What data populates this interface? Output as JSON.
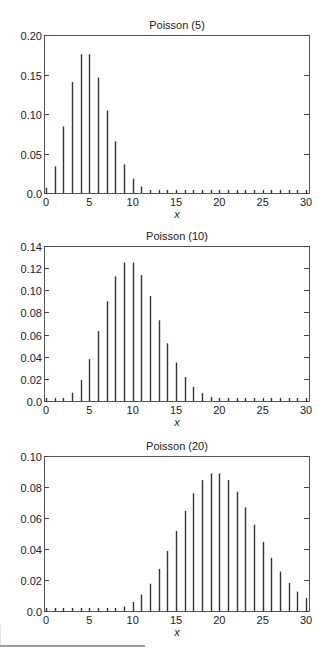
{
  "chart_data": [
    {
      "type": "bar",
      "title": "Poisson (5)",
      "xlabel": "x",
      "ylabel": "",
      "xlim": [
        0,
        30
      ],
      "ylim": [
        0,
        0.2
      ],
      "xticks": [
        "0",
        "5",
        "10",
        "15",
        "20",
        "25",
        "30"
      ],
      "yticks": [
        "0.0",
        "0.05",
        "0.10",
        "0.15",
        "0.20"
      ],
      "ytick_values": [
        0,
        0.05,
        0.1,
        0.15,
        0.2
      ],
      "grid": false,
      "legend": null,
      "x": [
        0,
        1,
        2,
        3,
        4,
        5,
        6,
        7,
        8,
        9,
        10,
        11,
        12,
        13,
        14,
        15,
        16,
        17,
        18,
        19,
        20,
        21,
        22,
        23,
        24,
        25,
        26,
        27,
        28,
        29,
        30
      ],
      "values": [
        0.0067,
        0.0337,
        0.0842,
        0.1404,
        0.1755,
        0.1755,
        0.1462,
        0.1044,
        0.0653,
        0.0363,
        0.0181,
        0.0082,
        0.0034,
        0.0013,
        0.0005,
        0.0002,
        0.0001,
        0,
        0,
        0,
        0,
        0,
        0,
        0,
        0,
        0,
        0,
        0,
        0,
        0,
        0
      ],
      "layout": {
        "top": 0,
        "height": 220,
        "plot_top": 35,
        "plot_bottom": 193
      }
    },
    {
      "type": "bar",
      "title": "Poisson (10)",
      "xlabel": "x",
      "ylabel": "",
      "xlim": [
        0,
        30
      ],
      "ylim": [
        0,
        0.14
      ],
      "xticks": [
        "0",
        "5",
        "10",
        "15",
        "20",
        "25",
        "30"
      ],
      "yticks": [
        "0.0",
        "0.02",
        "0.04",
        "0.06",
        "0.08",
        "0.10",
        "0.12",
        "0.14"
      ],
      "ytick_values": [
        0,
        0.02,
        0.04,
        0.06,
        0.08,
        0.1,
        0.12,
        0.14
      ],
      "grid": false,
      "legend": null,
      "x": [
        0,
        1,
        2,
        3,
        4,
        5,
        6,
        7,
        8,
        9,
        10,
        11,
        12,
        13,
        14,
        15,
        16,
        17,
        18,
        19,
        20,
        21,
        22,
        23,
        24,
        25,
        26,
        27,
        28,
        29,
        30
      ],
      "values": [
        0.0,
        0.0005,
        0.0023,
        0.0076,
        0.0189,
        0.0378,
        0.0631,
        0.0901,
        0.1126,
        0.1251,
        0.1251,
        0.1137,
        0.0948,
        0.0729,
        0.0521,
        0.0347,
        0.0217,
        0.0128,
        0.0071,
        0.0037,
        0.0019,
        0.0009,
        0.0004,
        0.0002,
        0.0001,
        0,
        0,
        0,
        0,
        0,
        0
      ],
      "layout": {
        "top": 220,
        "height": 215,
        "plot_top": 246,
        "plot_bottom": 401
      }
    },
    {
      "type": "bar",
      "title": "Poisson (20)",
      "xlabel": "x",
      "ylabel": "",
      "xlim": [
        0,
        30
      ],
      "ylim": [
        0,
        0.1
      ],
      "xticks": [
        "0",
        "5",
        "10",
        "15",
        "20",
        "25",
        "30"
      ],
      "yticks": [
        "0.0",
        "0.02",
        "0.04",
        "0.06",
        "0.08",
        "0.10"
      ],
      "ytick_values": [
        0,
        0.02,
        0.04,
        0.06,
        0.08,
        0.1
      ],
      "grid": false,
      "legend": null,
      "x": [
        0,
        1,
        2,
        3,
        4,
        5,
        6,
        7,
        8,
        9,
        10,
        11,
        12,
        13,
        14,
        15,
        16,
        17,
        18,
        19,
        20,
        21,
        22,
        23,
        24,
        25,
        26,
        27,
        28,
        29,
        30
      ],
      "values": [
        0,
        0,
        0,
        0,
        0,
        0.0001,
        0.0002,
        0.0005,
        0.0013,
        0.0029,
        0.0058,
        0.0106,
        0.0176,
        0.0271,
        0.0387,
        0.0516,
        0.0646,
        0.076,
        0.0844,
        0.0888,
        0.0888,
        0.0846,
        0.0769,
        0.0669,
        0.0557,
        0.0446,
        0.0343,
        0.0254,
        0.0181,
        0.0125,
        0.0083
      ],
      "layout": {
        "top": 430,
        "height": 219,
        "plot_top": 456,
        "plot_bottom": 611
      }
    }
  ],
  "figure": {
    "charts": [
      {
        "title": "Poisson (5)",
        "xlabel": "x"
      },
      {
        "title": "Poisson (10)",
        "xlabel": "x"
      },
      {
        "title": "Poisson (20)",
        "xlabel": "x"
      }
    ]
  }
}
